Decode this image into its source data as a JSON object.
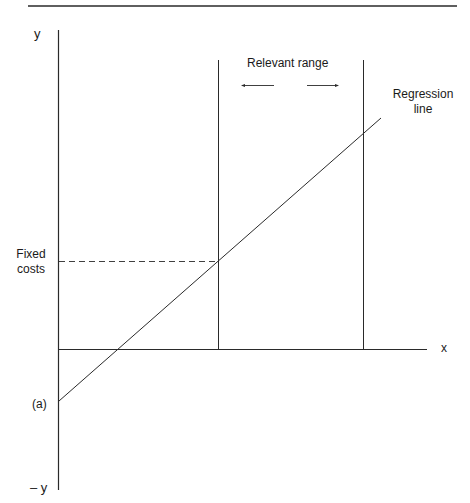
{
  "diagram": {
    "title": "",
    "axes": {
      "y_positive_label": "y",
      "y_negative_label": "– y",
      "x_label": "x"
    },
    "labels": {
      "relevant_range": "Relevant range",
      "regression_line": [
        "Regression",
        "line"
      ],
      "fixed_costs": [
        "Fixed",
        "costs"
      ],
      "intercept": "(a)"
    },
    "elements": [
      "Horizontal rule at top",
      "Y axis (vertical) extending into negative region",
      "X axis (horizontal)",
      "Two vertical boundary lines marking the relevant range",
      "Arrows pointing outward between boundaries",
      "Upward-sloping regression line crossing below the x axis at intercept (a)",
      "Dashed horizontal line from y axis to regression line at left boundary, labelled Fixed costs"
    ],
    "line_color": "#2a2a2a"
  }
}
